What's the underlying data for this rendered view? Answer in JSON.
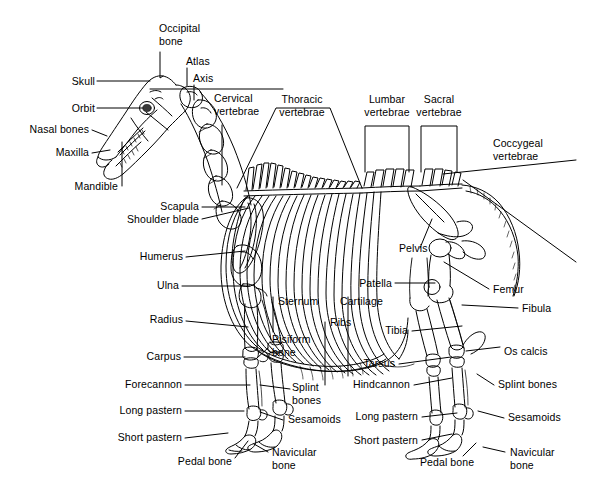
{
  "diagram": {
    "background_color": "#ffffff",
    "ink_color": "#000000",
    "width": 603,
    "height": 491
  },
  "labels": {
    "occipital_bone": "Occipital\nbone",
    "atlas": "Atlas",
    "axis": "Axis",
    "cervical": "Cervical\nvertebrae",
    "thoracic": "Thoracic\nvertebrae",
    "lumbar": "Lumbar\nvertebrae",
    "sacral": "Sacral\nvertebrae",
    "coccygeal": "Coccygeal\nvertebrae",
    "skull": "Skull",
    "orbit": "Orbit",
    "nasal_bones": "Nasal bones",
    "maxilla": "Maxilla",
    "mandible": "Mandible",
    "scapula": "Scapula",
    "shoulder_blade": "Shoulder blade",
    "humerus": "Humerus",
    "ulna": "Ulna",
    "radius": "Radius",
    "carpus": "Carpus",
    "forecannon": "Forecannon",
    "long_pastern_f": "Long pastern",
    "short_pastern_f": "Short pastern",
    "pedal_bone_f": "Pedal bone",
    "sternum": "Sternum",
    "ribs": "Ribs",
    "cartilage": "Cartilage",
    "pisiform_bone": "Pisiform\nbone",
    "splint_bones_f": "Splint\nbones",
    "sesamoids_f": "Sesamoids",
    "navicular_f": "Navicular\nbone",
    "pelvis": "Pelvis",
    "patella": "Patella",
    "femur": "Femur",
    "fibula": "Fibula",
    "tibia": "Tibia",
    "tarsus": "Tarsus",
    "os_calcis": "Os calcis",
    "hindcannon": "Hindcannon",
    "long_pastern_h": "Long pastern",
    "short_pastern_h": "Short pastern",
    "pedal_bone_h": "Pedal bone",
    "splint_bones_h": "Splint bones",
    "sesamoids_h": "Sesamoids",
    "navicular_h": "Navicular\nbone"
  }
}
